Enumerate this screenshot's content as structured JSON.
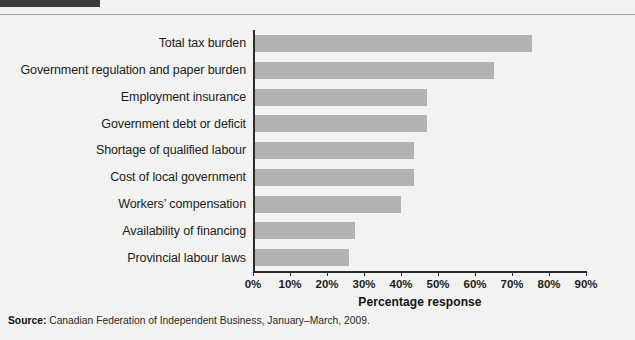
{
  "page": {
    "background_color": "#f2f2f0",
    "title_block_color": "#3a3a3a"
  },
  "source": {
    "label": "Source:",
    "text": " Canadian Federation of Independent Business, January–March, 2009."
  },
  "chart_data": {
    "type": "bar",
    "orientation": "horizontal",
    "title": "",
    "xlabel": "Percentage response",
    "ylabel": "",
    "xlim": [
      0,
      90
    ],
    "grid": false,
    "legend": false,
    "bar_color": "#b0b2b3",
    "axis_color": "#2b2b2b",
    "tick_labels": [
      "0%",
      "10%",
      "20%",
      "30%",
      "40%",
      "50%",
      "60%",
      "70%",
      "80%",
      "90%"
    ],
    "tick_values": [
      0,
      10,
      20,
      30,
      40,
      50,
      60,
      70,
      80,
      90
    ],
    "categories": [
      "Total tax burden",
      "Government regulation and paper burden",
      "Employment insurance",
      "Government debt or deficit",
      "Shortage of qualified labour",
      "Cost of local government",
      "Workers’ compensation",
      "Availability of financing",
      "Provincial labour laws"
    ],
    "values": [
      75.5,
      65,
      47,
      47,
      43.5,
      43.5,
      40,
      27.5,
      26
    ]
  }
}
